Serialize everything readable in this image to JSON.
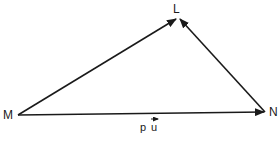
{
  "diagram": {
    "type": "vector-triangle",
    "points": [
      {
        "id": "M",
        "label": "M",
        "x": 18,
        "y": 115
      },
      {
        "id": "L",
        "label": "L",
        "x": 178,
        "y": 18
      },
      {
        "id": "N",
        "label": "N",
        "x": 265,
        "y": 112
      }
    ],
    "vectors": [
      {
        "from": "M",
        "to": "L",
        "label": ""
      },
      {
        "from": "N",
        "to": "L",
        "label": ""
      },
      {
        "from": "M",
        "to": "N",
        "label": "p u",
        "label_vector_over": "u"
      }
    ],
    "stroke_color": "#1a1a1a",
    "background": "#ffffff"
  },
  "labels": {
    "M": "M",
    "L": "L",
    "N": "N",
    "vec_p": "p",
    "vec_u": "u"
  }
}
